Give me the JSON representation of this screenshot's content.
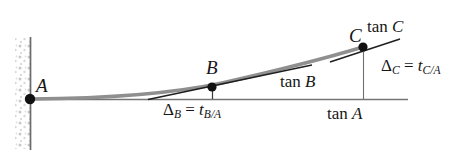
{
  "figure": {
    "background_color": "#ffffff",
    "beam_color": "#8c8c8c",
    "tangent_color": "#1a1a1a",
    "reference_line_color": "#707070",
    "wall_color": "#6b6b6b",
    "label_color": "#161616"
  },
  "points": {
    "a": {
      "label": "A",
      "x": 30,
      "y": 99,
      "description": "fixed support at wall"
    },
    "b": {
      "label": "B",
      "x": 212,
      "y": 87,
      "description": "intermediate point on elastic curve"
    },
    "c": {
      "label": "C",
      "x": 363,
      "y": 47,
      "description": "free end of elastic curve"
    }
  },
  "tangents": {
    "tan_a": {
      "label_up": "tan",
      "label_it": "A"
    },
    "tan_b": {
      "label_up": "tan",
      "label_it": "B"
    },
    "tan_c": {
      "label_up": "tan",
      "label_it": "C"
    }
  },
  "deviations": {
    "delta_b": {
      "delta": "Δ",
      "delta_sub": "B",
      "equals": " = ",
      "t": "t",
      "t_sub": "B/A",
      "full_text": "Δ_B = t_B/A"
    },
    "delta_c": {
      "delta": "Δ",
      "delta_sub": "C",
      "equals": " = ",
      "t": "t",
      "t_sub": "C/A",
      "full_text": "Δ_C = t_C/A"
    }
  },
  "wall": {
    "name": "fixed-support-wall",
    "x": 30,
    "y_top": 37,
    "y_bottom": 150,
    "hatching": "stippled"
  },
  "reference_line": {
    "name": "tan-A-horizontal-reference",
    "x_start": 30,
    "x_end": 408,
    "y": 99
  }
}
